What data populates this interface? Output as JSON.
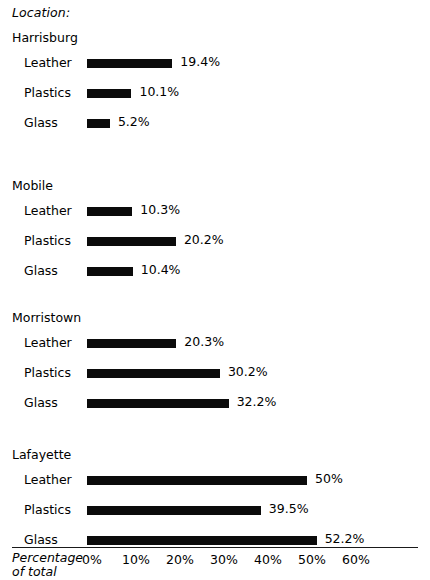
{
  "chart_data": {
    "type": "bar",
    "orientation": "horizontal",
    "title": "",
    "caption": "Location:",
    "xlabel": "Percentage of total",
    "ylabel": "",
    "xlim": [
      0,
      60
    ],
    "grid": false,
    "legend": "none",
    "tick_labels": [
      "0%",
      "10%",
      "20%",
      "30%",
      "40%",
      "50%",
      "60%"
    ],
    "tick_values": [
      0,
      10,
      20,
      30,
      40,
      50,
      60
    ],
    "categories": [
      "Leather",
      "Plastics",
      "Glass"
    ],
    "groups": [
      {
        "name": "Harrisburg",
        "bars": [
          {
            "label": "Leather",
            "value": 19.4,
            "value_label": "19.4%"
          },
          {
            "label": "Plastics",
            "value": 10.1,
            "value_label": "10.1%"
          },
          {
            "label": "Glass",
            "value": 5.2,
            "value_label": "5.2%"
          }
        ]
      },
      {
        "name": "Mobile",
        "bars": [
          {
            "label": "Leather",
            "value": 10.3,
            "value_label": "10.3%"
          },
          {
            "label": "Plastics",
            "value": 20.2,
            "value_label": "20.2%"
          },
          {
            "label": "Glass",
            "value": 10.4,
            "value_label": "10.4%"
          }
        ]
      },
      {
        "name": "Morristown",
        "bars": [
          {
            "label": "Leather",
            "value": 20.3,
            "value_label": "20.3%"
          },
          {
            "label": "Plastics",
            "value": 30.2,
            "value_label": "30.2%"
          },
          {
            "label": "Glass",
            "value": 32.2,
            "value_label": "32.2%"
          }
        ]
      },
      {
        "name": "Lafayette",
        "bars": [
          {
            "label": "Leather",
            "value": 50.0,
            "value_label": "50%"
          },
          {
            "label": "Plastics",
            "value": 39.5,
            "value_label": "39.5%"
          },
          {
            "label": "Glass",
            "value": 52.2,
            "value_label": "52.2%"
          }
        ]
      }
    ]
  },
  "axis": {
    "title_line1": "Percentage",
    "title_line2": "of total"
  },
  "style": {
    "bar_color": "#0b0b0b",
    "axis_color": "#1a1a1a",
    "background": "#ffffff"
  }
}
